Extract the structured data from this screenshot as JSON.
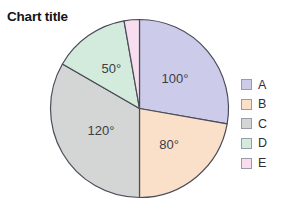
{
  "chart_data": {
    "type": "pie",
    "title": "Chart title",
    "start_angle_deg": 0,
    "direction": "clockwise",
    "total_deg": 360,
    "unit": "degrees",
    "categories": [
      "A",
      "B",
      "C",
      "D",
      "E"
    ],
    "values": [
      100,
      80,
      120,
      50,
      10
    ],
    "data_labels": [
      "100°",
      "80°",
      "120°",
      "50°",
      ""
    ],
    "slice_colors": [
      "#ccccea",
      "#fadfc9",
      "#d3d6d4",
      "#d3ebdd",
      "#f7dded"
    ],
    "slice_border_color": "#4c4c58",
    "legend_position": "right",
    "legend": [
      {
        "label": "A",
        "color": "#ccccea",
        "value": 100,
        "value_label": "100°"
      },
      {
        "label": "B",
        "color": "#fadfc9",
        "value": 80,
        "value_label": "80°"
      },
      {
        "label": "C",
        "color": "#d3d6d4",
        "value": 120,
        "value_label": "120°"
      },
      {
        "label": "D",
        "color": "#d3ebdd",
        "value": 50,
        "value_label": "50°"
      },
      {
        "label": "E",
        "color": "#f7dded",
        "value": 10,
        "value_label": ""
      }
    ],
    "label_color": "#3d3d46",
    "title_color": "#141414",
    "background": "#ffffff",
    "grid": false
  }
}
